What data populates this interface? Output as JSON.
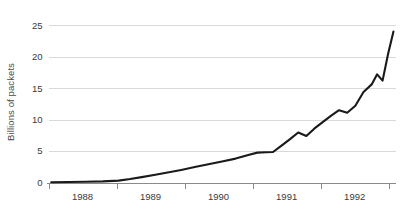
{
  "chart_data": {
    "type": "line",
    "title": "",
    "subtitle": "",
    "xlabel": "",
    "ylabel": "Billions of packets",
    "xlim": [
      1987.75,
      1992.85
    ],
    "ylim": [
      0,
      25.6
    ],
    "y_ticks": [
      0,
      5,
      10,
      15,
      20,
      25
    ],
    "y_tick_labels": [
      "0",
      "5",
      "10",
      "15",
      "20",
      "25"
    ],
    "x_ticks": [
      1987.75,
      1988.75,
      1989.75,
      1990.75,
      1991.75,
      1992.75
    ],
    "x_tick_labels": [
      "1988",
      "1989",
      "1990",
      "1991",
      "1992"
    ],
    "grid": "horizontal",
    "legend": "none",
    "series": [
      {
        "name": "Packets",
        "color": "#1a1a1a",
        "x": [
          1987.79,
          1988.05,
          1988.3,
          1988.55,
          1988.78,
          1988.95,
          1989.12,
          1989.3,
          1989.5,
          1989.7,
          1989.9,
          1990.1,
          1990.3,
          1990.5,
          1990.7,
          1990.82,
          1990.95,
          1991.05,
          1991.18,
          1991.3,
          1991.42,
          1991.54,
          1991.66,
          1991.78,
          1991.9,
          1992.02,
          1992.14,
          1992.26,
          1992.38,
          1992.5,
          1992.58,
          1992.66,
          1992.74,
          1992.82
        ],
        "y": [
          0.05,
          0.08,
          0.12,
          0.18,
          0.3,
          0.55,
          0.85,
          1.2,
          1.6,
          2.0,
          2.45,
          2.9,
          3.35,
          3.8,
          4.4,
          4.75,
          4.8,
          4.85,
          5.9,
          6.9,
          7.95,
          7.4,
          8.6,
          9.6,
          10.6,
          11.5,
          11.1,
          12.2,
          14.4,
          15.6,
          17.2,
          16.2,
          20.4,
          24.0
        ]
      }
    ]
  },
  "axis": {
    "y_label": "Billions of packets"
  }
}
